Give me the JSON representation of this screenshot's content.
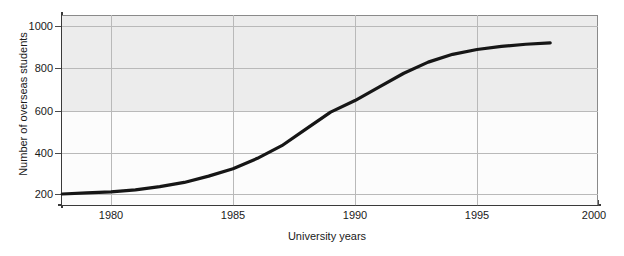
{
  "chart_data": {
    "type": "line",
    "title": "",
    "xlabel": "University years",
    "ylabel": "Number of overseas students",
    "xlim": [
      1978,
      2000
    ],
    "ylim": [
      170,
      1030
    ],
    "grid": true,
    "legend": false,
    "x_ticks": [
      "1980",
      "1985",
      "1990",
      "1995",
      "2000"
    ],
    "x_tick_values": [
      1980,
      1985,
      1990,
      1995,
      2000
    ],
    "y_ticks": [
      "200",
      "400",
      "600",
      "800",
      "1000"
    ],
    "y_tick_values": [
      200,
      400,
      600,
      800,
      1000
    ],
    "series": [
      {
        "name": "Number of overseas students",
        "color": "#161616",
        "x": [
          1978,
          1979,
          1980,
          1981,
          1982,
          1983,
          1984,
          1985,
          1986,
          1987,
          1988,
          1989,
          1990,
          1991,
          1992,
          1993,
          1994,
          1995,
          1996,
          1997,
          1998
        ],
        "values": [
          200,
          205,
          210,
          220,
          235,
          255,
          285,
          320,
          370,
          430,
          510,
          590,
          645,
          710,
          775,
          828,
          865,
          888,
          903,
          913,
          920
        ]
      }
    ]
  },
  "axes": {
    "y_title": "Number of overseas students",
    "x_title": "University years"
  }
}
